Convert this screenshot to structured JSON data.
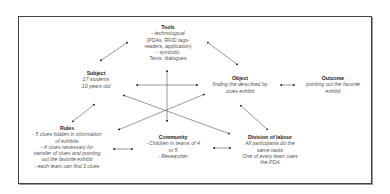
{
  "diagram": {
    "type": "activity-theory-triangle",
    "nodes": {
      "tools": {
        "title": "Tools",
        "lines": [
          "- technological",
          "(PDAs, RFID tags-",
          "readers, application)",
          "- symbolic",
          "Texts, dialogues"
        ]
      },
      "subject": {
        "title": "Subject",
        "lines": [
          "17 students",
          "10 years old"
        ]
      },
      "object": {
        "title": "Object",
        "lines": [
          "finding the described by",
          "clues exhibit"
        ]
      },
      "outcome": {
        "title": "Outcome",
        "lines": [
          "pointing out the favorite",
          "exhibit"
        ]
      },
      "rules": {
        "title": "Rules",
        "lines": [
          "- 5 clues hidden in information",
          "of exhibits",
          "- 4 clues necessary for",
          "transfer of clues and pointing",
          "out the favorite exhibit",
          "- each team can find 3 clues"
        ]
      },
      "community": {
        "title": "Community",
        "lines": [
          "- Children in teams of 4",
          "or 5",
          "- Researcher"
        ]
      },
      "division": {
        "title": "Division of labour",
        "lines": [
          "All participants do the",
          "same tasks",
          "One of every team uses",
          "the PDA"
        ]
      }
    },
    "edges": [
      {
        "from": "subject",
        "to": "tools",
        "arrows": "both"
      },
      {
        "from": "tools",
        "to": "object",
        "arrows": "both"
      },
      {
        "from": "subject",
        "to": "object",
        "arrows": "both"
      },
      {
        "from": "object",
        "to": "outcome",
        "arrows": "both"
      },
      {
        "from": "tools",
        "to": "community",
        "arrows": "end"
      },
      {
        "from": "subject",
        "to": "rules",
        "arrows": "both"
      },
      {
        "from": "object",
        "to": "rules",
        "arrows": "both"
      },
      {
        "from": "subject",
        "to": "division",
        "arrows": "both"
      },
      {
        "from": "object",
        "to": "division",
        "arrows": "both"
      },
      {
        "from": "rules",
        "to": "community",
        "arrows": "both"
      },
      {
        "from": "community",
        "to": "division",
        "arrows": "both"
      }
    ]
  }
}
